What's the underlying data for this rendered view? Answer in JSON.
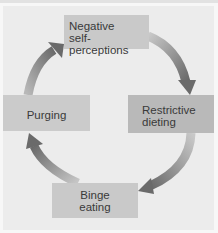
{
  "diagram": {
    "type": "cycle",
    "nodes": [
      {
        "id": "negative",
        "lines": [
          "Negative",
          "self-perceptions"
        ]
      },
      {
        "id": "restrictive",
        "lines": [
          "Restrictive",
          "dieting"
        ]
      },
      {
        "id": "binge",
        "lines": [
          "Binge",
          "eating"
        ]
      },
      {
        "id": "purging",
        "lines": [
          "Purging"
        ]
      }
    ],
    "edges": [
      {
        "from": "negative",
        "to": "restrictive"
      },
      {
        "from": "restrictive",
        "to": "binge"
      },
      {
        "from": "binge",
        "to": "purging"
      },
      {
        "from": "purging",
        "to": "negative"
      }
    ],
    "colors": {
      "background": "#ececec",
      "box": "#c9c9c9",
      "box_dark": "#b9b9b9",
      "arrow_light": "#c4c4c4",
      "arrow_dark": "#6a6a6a",
      "text": "#3a3a3a"
    }
  }
}
